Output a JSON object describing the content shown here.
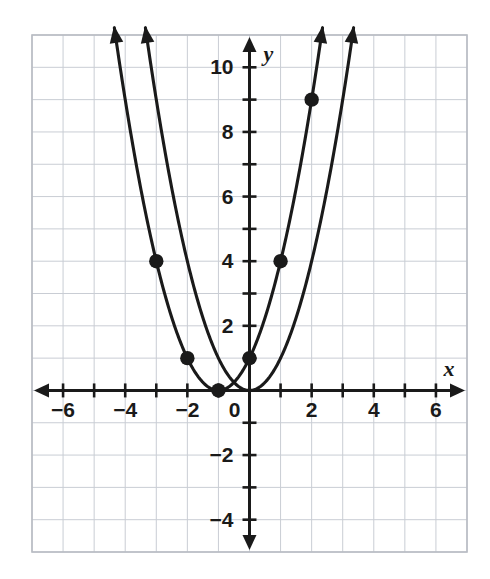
{
  "chart_data": {
    "type": "line",
    "title": "",
    "xlabel": "x",
    "ylabel": "y",
    "xlim": [
      -7,
      7
    ],
    "ylim": [
      -5,
      11
    ],
    "grid": true,
    "legend": "none",
    "x_ticks": [
      -6,
      -4,
      -2,
      0,
      2,
      4,
      6
    ],
    "x_tick_labels": [
      "−6",
      "−4",
      "−2",
      "0",
      "2",
      "4",
      "6"
    ],
    "y_ticks": [
      -4,
      -2,
      2,
      4,
      6,
      8,
      10
    ],
    "y_tick_labels": [
      "−4",
      "−2",
      "2",
      "4",
      "6",
      "8",
      "10"
    ],
    "minor_tick_step": 1,
    "series": [
      {
        "name": "y = x^2",
        "equation": "y = x²",
        "vertex": [
          0,
          0
        ],
        "curve_type": "parabola",
        "a": 1,
        "h": 0,
        "k": 0,
        "arrow_ends": "both",
        "x_domain": [
          -3.35,
          3.35
        ],
        "points": []
      },
      {
        "name": "y = (x+1)^2",
        "equation": "y = (x + 1)²",
        "vertex": [
          -1,
          0
        ],
        "curve_type": "parabola",
        "a": 1,
        "h": -1,
        "k": 0,
        "arrow_ends": "both",
        "x_domain": [
          -4.35,
          2.35
        ],
        "points": []
      }
    ],
    "marked_points": [
      {
        "x": -3,
        "y": 4,
        "label": "(-3, 4)"
      },
      {
        "x": -2,
        "y": 1,
        "label": "(-2, 1)"
      },
      {
        "x": -1,
        "y": 0,
        "label": "(-1, 0)"
      },
      {
        "x": 0,
        "y": 1,
        "label": "(0, 1)"
      },
      {
        "x": 1,
        "y": 4,
        "label": "(1, 4)"
      },
      {
        "x": 2,
        "y": 9,
        "label": "(2, 9)"
      }
    ],
    "colors": {
      "curve": "#1a1a1a",
      "axis": "#1a1a1a",
      "grid": "#c9cdd4",
      "point": "#1a1a1a",
      "border": "#b8bcc3",
      "background": "#ffffff"
    }
  }
}
